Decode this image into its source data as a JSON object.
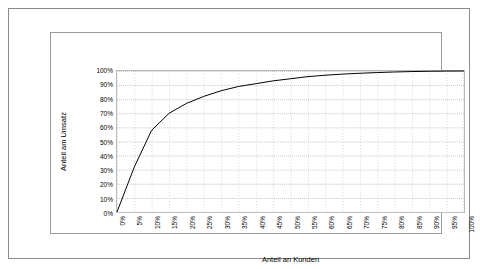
{
  "chart_data": {
    "type": "line",
    "title": "",
    "xlabel": "Anteil an Kunden",
    "ylabel": "Anteil am Umsatz",
    "xlim": [
      0,
      100
    ],
    "ylim": [
      0,
      100
    ],
    "grid": true,
    "legend": "none",
    "x_tick_labels": [
      "0%",
      "5%",
      "10%",
      "15%",
      "20%",
      "25%",
      "30%",
      "35%",
      "40%",
      "45%",
      "50%",
      "55%",
      "60%",
      "65%",
      "70%",
      "75%",
      "80%",
      "85%",
      "90%",
      "95%",
      "100%"
    ],
    "y_tick_labels": [
      "0%",
      "10%",
      "20%",
      "30%",
      "40%",
      "50%",
      "60%",
      "70%",
      "80%",
      "90%",
      "100%"
    ],
    "series": [
      {
        "name": "Konzentrationskurve",
        "x": [
          0,
          5,
          10,
          15,
          20,
          25,
          30,
          35,
          40,
          45,
          50,
          55,
          60,
          65,
          70,
          75,
          80,
          85,
          90,
          95,
          100
        ],
        "values": [
          0,
          32,
          58,
          70,
          77,
          82,
          86,
          89,
          91,
          93,
          94.5,
          96,
          97,
          97.8,
          98.4,
          98.9,
          99.3,
          99.6,
          99.8,
          99.95,
          100
        ]
      }
    ]
  }
}
